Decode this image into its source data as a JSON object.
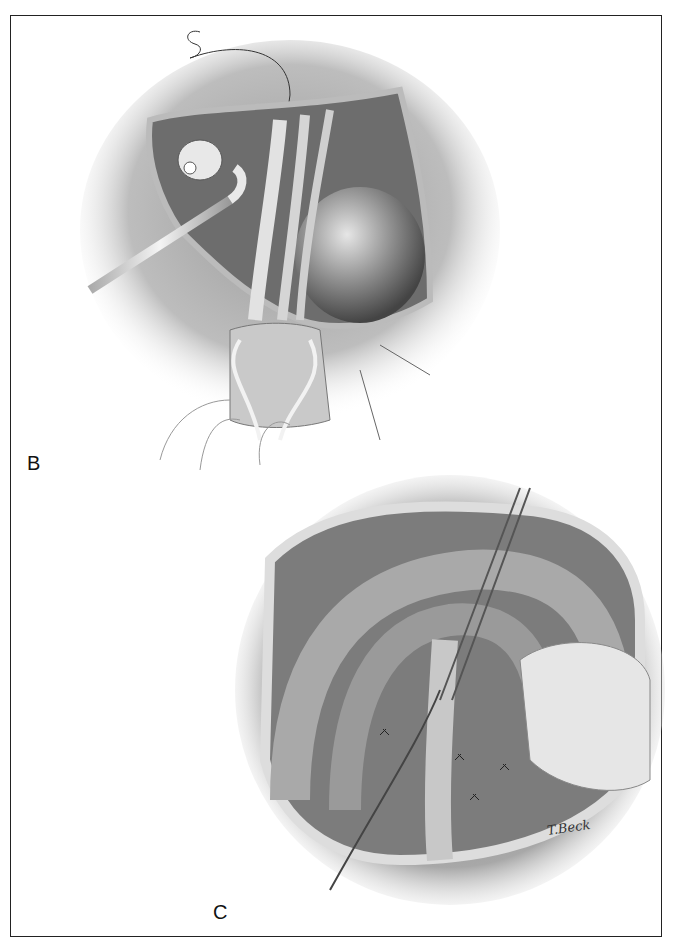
{
  "figure": {
    "panels": [
      {
        "label": "B",
        "description": "Surgical illustration: exposure with retractor, sutured vessels, drains and tube"
      },
      {
        "label": "C",
        "description": "Surgical illustration: abdominal field with forceps, sutured structures and gauze-covered hand"
      }
    ],
    "signature": "T.Beck",
    "colors": {
      "ink": "#111111",
      "tissue_dark": "#555555",
      "tissue_mid": "#8a8a8a",
      "tissue_light": "#d8d8d8",
      "background": "#ffffff"
    }
  }
}
